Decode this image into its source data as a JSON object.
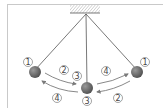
{
  "diagram": {
    "type": "pendulum-motion",
    "colors": {
      "frame": "#c9c9c9",
      "string": "#555555",
      "bob": "#6b6b6b",
      "arrow": "#7a7a7a",
      "label": "#444444"
    },
    "labels": {
      "left_bob": "1",
      "right_bob": "1",
      "center_top": "3",
      "center_bottom": "3",
      "arrow_left_to_center": "2",
      "arrow_center_to_left": "4",
      "arrow_center_to_right": "4",
      "arrow_right_to_center": "2"
    }
  }
}
